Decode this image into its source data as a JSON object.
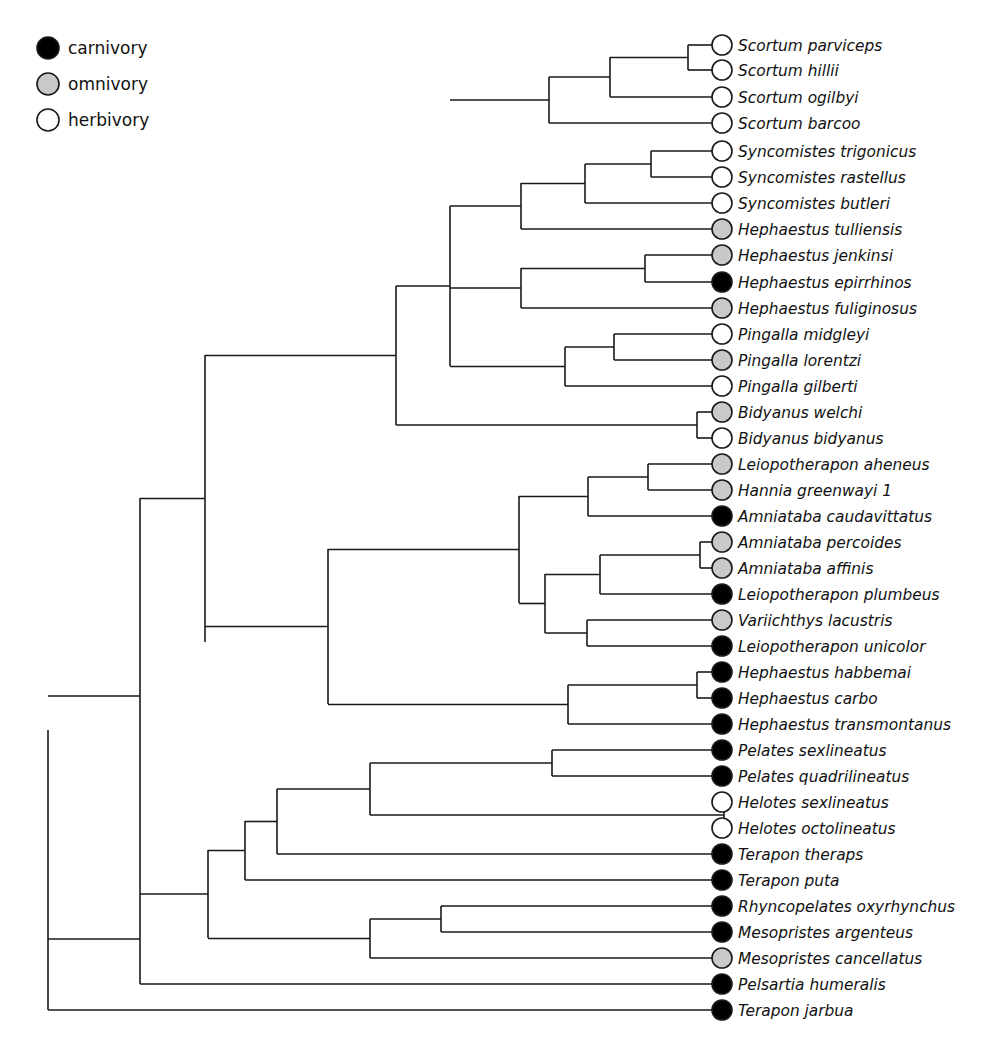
{
  "figure": {
    "type": "phylogenetic-tree",
    "title": "",
    "orientation": "left-to-right cladogram",
    "tip_count": 40
  },
  "legend": {
    "position": "top-left",
    "items": [
      {
        "label": "carnivory",
        "state": "carnivory",
        "color": "#000000"
      },
      {
        "label": "omnivory",
        "state": "omnivory",
        "color": "#c9c9c9"
      },
      {
        "label": "herbivory",
        "state": "herbivory",
        "color": "#ffffff"
      }
    ]
  },
  "colors": {
    "carnivory": "#000000",
    "omnivory": "#c9c9c9",
    "herbivory": "#ffffff",
    "branch": "#1a1a1a",
    "background": "#ffffff"
  },
  "chart_data": {
    "type": "tree",
    "title": "",
    "xlabel": "",
    "ylabel": "",
    "tip_labels": [
      "Scortum parviceps",
      "Scortum hillii",
      "Scortum ogilbyi",
      "Scortum barcoo",
      "Syncomistes trigonicus",
      "Syncomistes rastellus",
      "Syncomistes butleri",
      "Hephaestus tulliensis",
      "Hephaestus jenkinsi",
      "Hephaestus epirrhinos",
      "Hephaestus fuliginosus",
      "Pingalla midgleyi",
      "Pingalla lorentzi",
      "Pingalla gilberti",
      "Bidyanus welchi",
      "Bidyanus bidyanus",
      "Leiopotherapon aheneus",
      "Hannia greenwayi 1",
      "Amniataba caudavittatus",
      "Amniataba percoides",
      "Amniataba affinis",
      "Leiopotherapon plumbeus",
      "Variichthys lacustris",
      "Leiopotherapon unicolor",
      "Hephaestus habbemai",
      "Hephaestus carbo",
      "Hephaestus transmontanus",
      "Pelates sexlineatus",
      "Pelates quadrilineatus",
      "Helotes sexlineatus",
      "Helotes octolineatus",
      "Terapon theraps",
      "Terapon puta",
      "Rhyncopelates oxyrhynchus",
      "Mesopristes argenteus",
      "Mesopristes cancellatus",
      "Pelsartia humeralis",
      "Terapon jarbua"
    ],
    "tip_states": [
      "herbivory",
      "herbivory",
      "herbivory",
      "herbivory",
      "herbivory",
      "herbivory",
      "herbivory",
      "omnivory",
      "omnivory",
      "carnivory",
      "omnivory",
      "herbivory",
      "omnivory",
      "herbivory",
      "omnivory",
      "herbivory",
      "omnivory",
      "omnivory",
      "carnivory",
      "omnivory",
      "omnivory",
      "carnivory",
      "omnivory",
      "carnivory",
      "carnivory",
      "carnivory",
      "carnivory",
      "carnivory",
      "carnivory",
      "herbivory",
      "herbivory",
      "carnivory",
      "carnivory",
      "carnivory",
      "carnivory",
      "omnivory",
      "carnivory",
      "carnivory"
    ],
    "state_counts": {
      "carnivory": 16,
      "omnivory": 11,
      "herbivory": 11
    },
    "tips": [
      {
        "label": "Scortum parviceps",
        "state": "herbivory",
        "y": 45,
        "x": 722
      },
      {
        "label": "Scortum hillii",
        "state": "herbivory",
        "y": 70,
        "x": 722
      },
      {
        "label": "Scortum ogilbyi",
        "state": "herbivory",
        "y": 97,
        "x": 722
      },
      {
        "label": "Scortum barcoo",
        "state": "herbivory",
        "y": 123,
        "x": 722
      },
      {
        "label": "Syncomistes trigonicus",
        "state": "herbivory",
        "y": 151,
        "x": 722
      },
      {
        "label": "Syncomistes rastellus",
        "state": "herbivory",
        "y": 177,
        "x": 722
      },
      {
        "label": "Syncomistes butleri",
        "state": "herbivory",
        "y": 203,
        "x": 722
      },
      {
        "label": "Hephaestus tulliensis",
        "state": "omnivory",
        "y": 229,
        "x": 722
      },
      {
        "label": "Hephaestus jenkinsi",
        "state": "omnivory",
        "y": 255,
        "x": 722
      },
      {
        "label": "Hephaestus epirrhinos",
        "state": "carnivory",
        "y": 282,
        "x": 722
      },
      {
        "label": "Hephaestus fuliginosus",
        "state": "omnivory",
        "y": 308,
        "x": 722
      },
      {
        "label": "Pingalla midgleyi",
        "state": "herbivory",
        "y": 334,
        "x": 722
      },
      {
        "label": "Pingalla lorentzi",
        "state": "omnivory",
        "y": 360,
        "x": 722
      },
      {
        "label": "Pingalla gilberti",
        "state": "herbivory",
        "y": 386,
        "x": 722
      },
      {
        "label": "Bidyanus welchi",
        "state": "omnivory",
        "y": 412,
        "x": 722
      },
      {
        "label": "Bidyanus bidyanus",
        "state": "herbivory",
        "y": 438,
        "x": 722
      },
      {
        "label": "Leiopotherapon aheneus",
        "state": "omnivory",
        "y": 464,
        "x": 722
      },
      {
        "label": "Hannia greenwayi 1",
        "state": "omnivory",
        "y": 490,
        "x": 722
      },
      {
        "label": "Amniataba caudavittatus",
        "state": "carnivory",
        "y": 516,
        "x": 722
      },
      {
        "label": "Amniataba percoides",
        "state": "omnivory",
        "y": 542,
        "x": 722
      },
      {
        "label": "Amniataba affinis",
        "state": "omnivory",
        "y": 568,
        "x": 722
      },
      {
        "label": "Leiopotherapon plumbeus",
        "state": "carnivory",
        "y": 594,
        "x": 722
      },
      {
        "label": "Variichthys lacustris",
        "state": "omnivory",
        "y": 620,
        "x": 722
      },
      {
        "label": "Leiopotherapon unicolor",
        "state": "carnivory",
        "y": 646,
        "x": 722
      },
      {
        "label": "Hephaestus habbemai",
        "state": "carnivory",
        "y": 672,
        "x": 722
      },
      {
        "label": "Hephaestus carbo",
        "state": "carnivory",
        "y": 698,
        "x": 722
      },
      {
        "label": "Hephaestus transmontanus",
        "state": "carnivory",
        "y": 724,
        "x": 722
      },
      {
        "label": "Pelates sexlineatus",
        "state": "carnivory",
        "y": 750,
        "x": 722
      },
      {
        "label": "Pelates quadrilineatus",
        "state": "carnivory",
        "y": 776,
        "x": 722
      },
      {
        "label": "Helotes sexlineatus",
        "state": "herbivory",
        "y": 802,
        "x": 722
      },
      {
        "label": "Helotes octolineatus",
        "state": "herbivory",
        "y": 828,
        "x": 722
      },
      {
        "label": "Terapon theraps",
        "state": "carnivory",
        "y": 854,
        "x": 722
      },
      {
        "label": "Terapon puta",
        "state": "carnivory",
        "y": 880,
        "x": 722
      },
      {
        "label": "Rhyncopelates oxyrhynchus",
        "state": "carnivory",
        "y": 906,
        "x": 722
      },
      {
        "label": "Mesopristes argenteus",
        "state": "carnivory",
        "y": 932,
        "x": 722
      },
      {
        "label": "Mesopristes cancellatus",
        "state": "omnivory",
        "y": 958,
        "x": 722
      },
      {
        "label": "Pelsartia humeralis",
        "state": "carnivory",
        "y": 984,
        "x": 722
      },
      {
        "label": "Terapon jarbua",
        "state": "carnivory",
        "y": 1010,
        "x": 722
      }
    ],
    "internal_nodes": [
      {
        "name": "scortum-parviceps-hillii",
        "x": 688,
        "y_top": 45,
        "y_bot": 70,
        "parent_x": 610
      },
      {
        "name": "scortum-ogilbyi-clade",
        "x": 610,
        "y_top": 57,
        "y_bot": 97,
        "parent_x": 549
      },
      {
        "name": "scortum-clade",
        "x": 549,
        "y_top": 77,
        "y_bot": 123,
        "parent_x": 450
      },
      {
        "name": "syncomistes-trig-rast",
        "x": 651,
        "y_top": 151,
        "y_bot": 177,
        "parent_x": 585
      },
      {
        "name": "syncomistes-clade",
        "x": 585,
        "y_top": 164,
        "y_bot": 203,
        "parent_x": 521
      },
      {
        "name": "syncomistes-tulliensis",
        "x": 521,
        "y_top": 183,
        "y_bot": 229,
        "parent_x": 450
      },
      {
        "name": "hephaestus-jenk-epirr",
        "x": 645,
        "y_top": 255,
        "y_bot": 282,
        "parent_x": 521
      },
      {
        "name": "hephaestus-fulig-clade",
        "x": 521,
        "y_top": 268,
        "y_bot": 308,
        "parent_x": 450
      },
      {
        "name": "pingalla-midg-lor",
        "x": 614,
        "y_top": 334,
        "y_bot": 360,
        "parent_x": 565
      },
      {
        "name": "pingalla-clade",
        "x": 565,
        "y_top": 347,
        "y_bot": 386,
        "parent_x": 450
      },
      {
        "name": "hephaestus-pingalla-clade",
        "x": 450,
        "y_top": 206,
        "y_bot": 366,
        "parent_x": 396
      },
      {
        "name": "bidyanus-pair",
        "x": 697,
        "y_top": 412,
        "y_bot": 438,
        "parent_x": 396
      },
      {
        "name": "upper-major-clade",
        "x": 396,
        "y_top": 286,
        "y_bot": 425,
        "parent_x": 205
      },
      {
        "name": "aheneus-greenwayi",
        "x": 648,
        "y_top": 464,
        "y_bot": 490,
        "parent_x": 588
      },
      {
        "name": "caudavittatus-clade",
        "x": 588,
        "y_top": 477,
        "y_bot": 516,
        "parent_x": 519
      },
      {
        "name": "amniataba-pair",
        "x": 700,
        "y_top": 542,
        "y_bot": 568,
        "parent_x": 600
      },
      {
        "name": "plumbeus-clade",
        "x": 600,
        "y_top": 555,
        "y_bot": 594,
        "parent_x": 545
      },
      {
        "name": "lacustris-unicolor",
        "x": 587,
        "y_top": 620,
        "y_bot": 646,
        "parent_x": 545
      },
      {
        "name": "plumbeus-unicolor-clade",
        "x": 545,
        "y_top": 574,
        "y_bot": 633,
        "parent_x": 519
      },
      {
        "name": "leiopotherapon-superclade",
        "x": 519,
        "y_top": 496,
        "y_bot": 603,
        "parent_x": 328
      },
      {
        "name": "habbemai-carbo",
        "x": 697,
        "y_top": 672,
        "y_bot": 698,
        "parent_x": 568
      },
      {
        "name": "hephaestus-habbemai-clade",
        "x": 568,
        "y_top": 685,
        "y_bot": 724,
        "parent_x": 328
      },
      {
        "name": "middle-major-clade",
        "x": 328,
        "y_top": 549,
        "y_bot": 704,
        "parent_x": 205
      },
      {
        "name": "upper-middle-ancestor",
        "x": 205,
        "y_top": 355,
        "y_bot": 642,
        "parent_x": 140
      },
      {
        "name": "pelates-pair",
        "x": 552,
        "y_top": 750,
        "y_bot": 776,
        "parent_x": 370
      },
      {
        "name": "helotes-pair",
        "x": 724,
        "y_top": 802,
        "y_bot": 828,
        "parent_x": 370
      },
      {
        "name": "pelates-helotes-clade",
        "x": 370,
        "y_top": 763,
        "y_bot": 815,
        "parent_x": 277
      },
      {
        "name": "theraps-clade",
        "x": 277,
        "y_top": 789,
        "y_bot": 854,
        "parent_x": 245
      },
      {
        "name": "puta-clade",
        "x": 245,
        "y_top": 821,
        "y_bot": 880,
        "parent_x": 208
      },
      {
        "name": "rhyncopelates-mesopristes",
        "x": 441,
        "y_top": 906,
        "y_bot": 932,
        "parent_x": 370
      },
      {
        "name": "mesopristes-clade",
        "x": 370,
        "y_top": 919,
        "y_bot": 958,
        "parent_x": 208
      },
      {
        "name": "lower-clade",
        "x": 208,
        "y_top": 850,
        "y_bot": 938,
        "parent_x": 140
      },
      {
        "name": "pelsartia-ancestor",
        "x": 140,
        "y_top": 498,
        "y_bot": 894,
        "parent_x": 48
      },
      {
        "name": "humeralis-join",
        "x": 140,
        "y_top": 894,
        "y_bot": 984,
        "parent_x": 48
      },
      {
        "name": "root",
        "x": 48,
        "y_top": 730,
        "y_bot": 1010,
        "parent_x": 48
      }
    ]
  }
}
